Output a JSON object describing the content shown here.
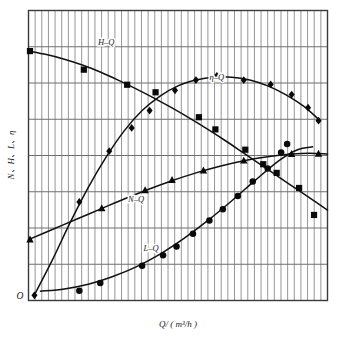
{
  "chart_data": {
    "type": "line",
    "title": "",
    "subtitle": "",
    "xlabel": "Q/ ( m³/h )",
    "ylabel": "N、H、L、η",
    "origin_label": "O",
    "grid": {
      "vertical_minor_lines": 45,
      "horizontal_major_lines": 7,
      "show_vertical": true,
      "show_horizontal": true
    },
    "axis": {
      "xlim": [
        0,
        100
      ],
      "ylim": [
        0,
        100
      ],
      "x_ticks_labeled": false,
      "y_ticks_labeled": false
    },
    "legend": {
      "position": "inline-on-curves",
      "entries": [
        "H–Q",
        "η–Q",
        "N–Q",
        "L–Q"
      ]
    },
    "series": [
      {
        "name": "H–Q",
        "label": "H–Q",
        "marker": "square",
        "label_x": 26,
        "label_y": 88,
        "curve": [
          [
            0.0,
            86.0
          ],
          [
            6.0,
            84.8
          ],
          [
            12.0,
            83.2
          ],
          [
            18.0,
            81.2
          ],
          [
            24.0,
            78.8
          ],
          [
            30.0,
            76.0
          ],
          [
            36.0,
            73.0
          ],
          [
            42.0,
            69.8
          ],
          [
            48.0,
            66.4
          ],
          [
            54.0,
            62.8
          ],
          [
            60.0,
            59.0
          ],
          [
            66.0,
            55.0
          ],
          [
            72.0,
            50.8
          ],
          [
            78.0,
            46.6
          ],
          [
            84.0,
            42.4
          ],
          [
            90.0,
            38.2
          ],
          [
            96.0,
            34.0
          ],
          [
            100.0,
            31.2
          ]
        ],
        "points": [
          [
            0.5,
            86.0
          ],
          [
            18.5,
            79.6
          ],
          [
            33.0,
            74.4
          ],
          [
            42.5,
            71.8
          ],
          [
            57.0,
            63.2
          ],
          [
            62.5,
            59.0
          ],
          [
            72.5,
            52.0
          ],
          [
            78.5,
            47.0
          ],
          [
            83.0,
            44.0
          ],
          [
            90.5,
            38.8
          ],
          [
            95.5,
            29.5
          ]
        ]
      },
      {
        "name": "η–Q",
        "label": "η–Q",
        "marker": "diamond",
        "label_x": 63,
        "label_y": 76,
        "curve": [
          [
            2.0,
            2.0
          ],
          [
            8.0,
            14.0
          ],
          [
            14.0,
            27.0
          ],
          [
            20.0,
            39.0
          ],
          [
            26.0,
            49.5
          ],
          [
            32.0,
            58.5
          ],
          [
            38.0,
            65.5
          ],
          [
            44.0,
            70.5
          ],
          [
            50.0,
            74.0
          ],
          [
            56.0,
            76.0
          ],
          [
            62.0,
            77.0
          ],
          [
            68.0,
            77.0
          ],
          [
            74.0,
            76.0
          ],
          [
            80.0,
            74.0
          ],
          [
            86.0,
            71.0
          ],
          [
            92.0,
            67.0
          ],
          [
            97.0,
            62.5
          ]
        ],
        "points": [
          [
            2.0,
            1.8
          ],
          [
            17.0,
            34.0
          ],
          [
            27.0,
            51.5
          ],
          [
            34.5,
            59.5
          ],
          [
            40.5,
            65.5
          ],
          [
            49.0,
            72.5
          ],
          [
            56.0,
            76.0
          ],
          [
            63.0,
            77.5
          ],
          [
            72.0,
            76.0
          ],
          [
            81.0,
            74.5
          ],
          [
            88.0,
            71.0
          ],
          [
            93.5,
            66.5
          ],
          [
            97.0,
            62.0
          ]
        ]
      },
      {
        "name": "N–Q",
        "label": "N–Q",
        "marker": "triangle",
        "label_x": 36,
        "label_y": 34,
        "curve": [
          [
            0.0,
            21.0
          ],
          [
            8.0,
            24.5
          ],
          [
            16.0,
            28.0
          ],
          [
            24.0,
            31.5
          ],
          [
            32.0,
            35.0
          ],
          [
            40.0,
            38.3
          ],
          [
            48.0,
            41.3
          ],
          [
            56.0,
            44.0
          ],
          [
            64.0,
            46.3
          ],
          [
            72.0,
            48.2
          ],
          [
            80.0,
            49.6
          ],
          [
            88.0,
            50.5
          ],
          [
            94.0,
            50.8
          ],
          [
            100.0,
            50.5
          ]
        ],
        "points": [
          [
            0.5,
            21.0
          ],
          [
            24.5,
            31.8
          ],
          [
            39.0,
            38.0
          ],
          [
            48.0,
            41.5
          ],
          [
            58.5,
            44.8
          ],
          [
            72.0,
            48.2
          ],
          [
            88.0,
            50.5
          ],
          [
            97.0,
            50.6
          ]
        ]
      },
      {
        "name": "L–Q",
        "label": "L–Q",
        "marker": "circle",
        "label_x": 41,
        "label_y": 17,
        "curve": [
          [
            4.0,
            3.2
          ],
          [
            12.0,
            4.0
          ],
          [
            20.0,
            5.6
          ],
          [
            28.0,
            8.2
          ],
          [
            36.0,
            11.6
          ],
          [
            44.0,
            16.0
          ],
          [
            52.0,
            21.4
          ],
          [
            60.0,
            27.6
          ],
          [
            68.0,
            34.4
          ],
          [
            76.0,
            41.6
          ],
          [
            84.0,
            48.4
          ],
          [
            90.0,
            52.0
          ],
          [
            95.0,
            53.0
          ]
        ],
        "points": [
          [
            17.0,
            3.4
          ],
          [
            24.0,
            6.0
          ],
          [
            38.0,
            12.0
          ],
          [
            45.0,
            15.6
          ],
          [
            49.5,
            18.6
          ],
          [
            55.0,
            23.0
          ],
          [
            60.5,
            27.6
          ],
          [
            65.0,
            31.5
          ],
          [
            70.0,
            36.0
          ],
          [
            75.0,
            41.0
          ],
          [
            80.0,
            45.5
          ],
          [
            84.5,
            51.0
          ],
          [
            86.5,
            54.0
          ]
        ]
      }
    ]
  }
}
